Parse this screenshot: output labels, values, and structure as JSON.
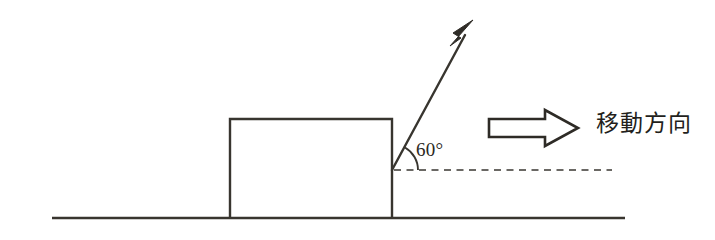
{
  "figure": {
    "type": "physics-force-diagram",
    "background_color": "#ffffff",
    "line_color": "#38352f",
    "width": 715,
    "height": 240
  },
  "labels": {
    "angle": "60°",
    "angle_value": 60,
    "angle_unit": "degrees",
    "direction_text": "移動方向"
  },
  "elements": {
    "ground_line": {
      "name": "ground-line",
      "x1": 52,
      "y1": 218,
      "x2": 625,
      "y2": 218
    },
    "block": {
      "name": "block-box",
      "left": 230,
      "right": 392,
      "top": 119,
      "bottom": 218
    },
    "force_vector": {
      "name": "force-vector-arrow",
      "origin_x": 392,
      "origin_y": 170,
      "tip_x": 472,
      "tip_y": 22,
      "angle_from_horizontal": 60
    },
    "reference_line": {
      "name": "horizontal-dashed-reference",
      "x1": 393,
      "y1": 170,
      "x2": 612,
      "y2": 170,
      "style": "dashed"
    },
    "angle_arc": {
      "name": "angle-arc",
      "center_x": 392,
      "center_y": 170,
      "radius": 26
    },
    "direction_arrow": {
      "name": "movement-direction-block-arrow",
      "left": 488,
      "right": 578,
      "center_y": 128,
      "points_toward": "right"
    }
  }
}
